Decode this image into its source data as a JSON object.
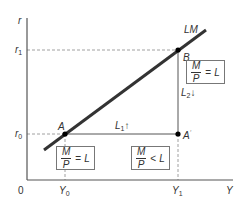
{
  "axes": {
    "y_label": "r",
    "x_label": "Y",
    "origin_label": "0",
    "y_ticks": [
      {
        "base": "r",
        "sub": "1"
      },
      {
        "base": "r",
        "sub": "0"
      }
    ],
    "x_ticks": [
      {
        "base": "Y",
        "sub": "0"
      },
      {
        "base": "Y",
        "sub": "1"
      }
    ]
  },
  "curve": {
    "label": "LM",
    "color": "#333333"
  },
  "points": {
    "A": {
      "label": "A"
    },
    "A_prime": {
      "label": "A",
      "mark": "′"
    },
    "B": {
      "label": "B"
    }
  },
  "moves": {
    "L1": {
      "base": "L",
      "sub": "1",
      "arrow": "↑"
    },
    "L2": {
      "base": "L",
      "sub": "2",
      "arrow": "↓"
    }
  },
  "conditions": {
    "at_A": {
      "num": "M",
      "den": "P",
      "rel": "=",
      "rhs": "L"
    },
    "at_A_prime": {
      "num": "M",
      "den": "P",
      "rel": "<",
      "rhs": "L"
    },
    "at_B": {
      "num": "M",
      "den": "P",
      "rel": "=",
      "rhs": "L"
    }
  },
  "colors": {
    "axis": "#555555",
    "curve": "#333333",
    "dashed": "#888888",
    "point": "#000000"
  }
}
